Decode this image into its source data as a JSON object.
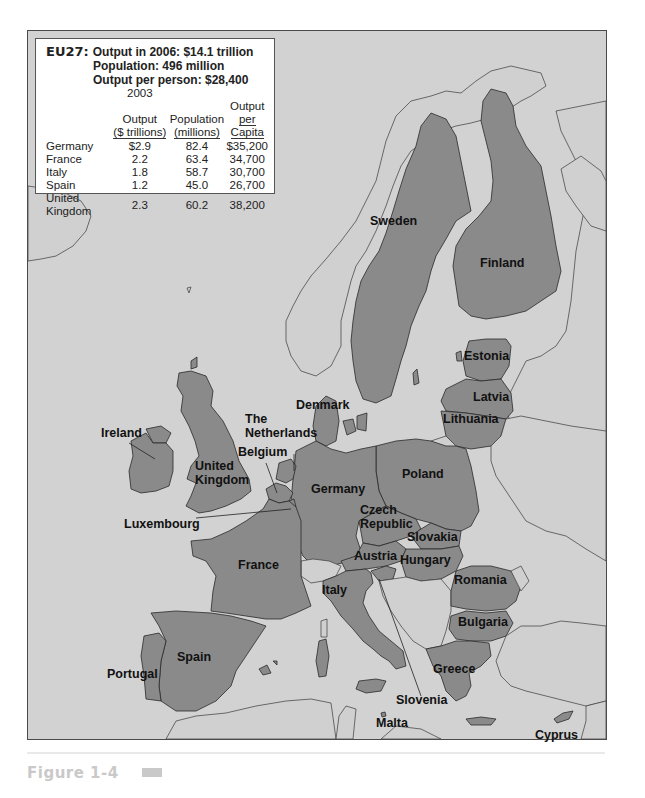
{
  "info_box": {
    "heading_label": "EU27:",
    "line1": "Output in 2006: $14.1 trillion",
    "line2": "Population: 496 million",
    "line3": "Output per person: $28,400",
    "table_year": "2003",
    "columns": [
      {
        "line1": "Output",
        "line2": "($ trillions)"
      },
      {
        "line1": "Population",
        "line2": "(millions)"
      },
      {
        "line1": "Output",
        "line2": "per Capita"
      }
    ],
    "rows": [
      {
        "country": "Germany",
        "output": "$2.9",
        "population": "82.4",
        "per_capita": "$35,200"
      },
      {
        "country": "France",
        "output": "2.2",
        "population": "63.4",
        "per_capita": "34,700"
      },
      {
        "country": "Italy",
        "output": "1.8",
        "population": "58.7",
        "per_capita": "30,700"
      },
      {
        "country": "Spain",
        "output": "1.2",
        "population": "45.0",
        "per_capita": "26,700"
      },
      {
        "country": "United Kingdom",
        "output": "2.3",
        "population": "60.2",
        "per_capita": "38,200"
      }
    ]
  },
  "map": {
    "title": "European Union member states (EU27)",
    "colors": {
      "eu_member": "#8a8a8a",
      "non_member_land": "#d0d0d0",
      "sea": "#d2d2d2",
      "border": "#2a2a2a"
    },
    "labels": {
      "sweden": "Sweden",
      "finland": "Finland",
      "estonia": "Estonia",
      "latvia": "Latvia",
      "lithuania": "Lithuania",
      "denmark": "Denmark",
      "ireland": "Ireland",
      "the_netherlands_1": "The",
      "the_netherlands_2": "Netherlands",
      "belgium": "Belgium",
      "united_kingdom_1": "United",
      "united_kingdom_2": "Kingdom",
      "germany": "Germany",
      "poland": "Poland",
      "czech_1": "Czech",
      "czech_2": "Republic",
      "slovakia": "Slovakia",
      "luxembourg": "Luxembourg",
      "austria": "Austria",
      "hungary": "Hungary",
      "france": "France",
      "romania": "Romania",
      "italy": "Italy",
      "bulgaria": "Bulgaria",
      "spain": "Spain",
      "portugal": "Portugal",
      "greece": "Greece",
      "slovenia": "Slovenia",
      "malta": "Malta",
      "cyprus": "Cyprus"
    }
  },
  "figure": {
    "caption": "Figure 1-4"
  }
}
